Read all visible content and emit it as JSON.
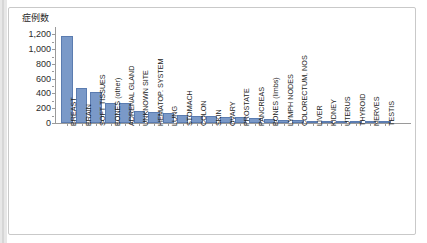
{
  "figure": {
    "axis_title": "症例数",
    "bar_color": "#7a99c8",
    "bar_edge_color": "#5b7cb0",
    "axis_color": "#9a9a9a",
    "frame_color": "#c9c9c9"
  },
  "chart_data": {
    "type": "bar",
    "title": "",
    "subtitle": "",
    "xlabel": "",
    "ylabel": "症例数",
    "ylim": [
      0,
      1300
    ],
    "yticks": [
      0,
      200,
      400,
      600,
      800,
      1000,
      1200
    ],
    "ytick_labels": [
      "0",
      "200",
      "400",
      "600",
      "800",
      "1,000",
      "1,200"
    ],
    "grid": false,
    "legend": false,
    "categories": [
      "BREAST",
      "BRAIN",
      "SOFT TISSUES",
      "BONES (other)",
      "ADRENAL GLAND",
      "UNKNOWN SITE",
      "HEMATOP. SYSTEM",
      "LUNG",
      "STOMACH",
      "COLON",
      "SKIN",
      "OVARY",
      "PROSTATE",
      "PANCREAS",
      "BONES (limbs)",
      "LYMPH NODES",
      "COLORECTUM, NOS",
      "LIVER",
      "KIDNEY",
      "UTERUS",
      "THYROID",
      "NERVES",
      "TESTIS"
    ],
    "values": [
      1180,
      470,
      415,
      275,
      270,
      160,
      143,
      133,
      108,
      100,
      92,
      85,
      75,
      62,
      52,
      45,
      38,
      30,
      22,
      16,
      12,
      8,
      5
    ]
  }
}
